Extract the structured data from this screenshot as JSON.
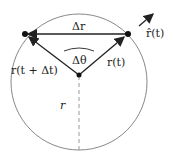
{
  "diagram": {
    "labels": {
      "delta_r": "Δr",
      "r_hat": "r̂(t)",
      "r_t": "r(t)",
      "r_t_dt": "r(t + Δt)",
      "delta_theta": "Δθ",
      "radius": "r"
    },
    "colors": {
      "circle": "#888888",
      "vectors": "#222222",
      "dashed": "#999999"
    }
  }
}
